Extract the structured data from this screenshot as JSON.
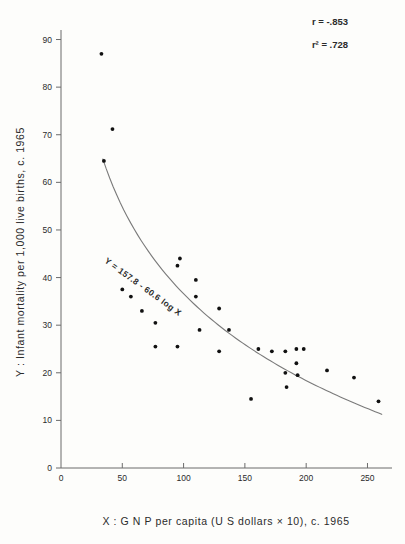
{
  "chart_data": {
    "type": "scatter",
    "title": "",
    "xlabel": "X : G N P  per  capita  (U S  dollars  × 10),  c. 1965",
    "ylabel": "Y :  Infant  mortality  per  1,000  live  births,  c. 1965",
    "xlim": [
      0,
      270
    ],
    "ylim": [
      0,
      92
    ],
    "xticks": [
      0,
      50,
      100,
      150,
      200,
      250
    ],
    "yticks": [
      0,
      10,
      20,
      30,
      40,
      50,
      60,
      70,
      80,
      90
    ],
    "xticklabels": [
      "0",
      "50",
      "100",
      "150",
      "200",
      "250"
    ],
    "yticklabels": [
      "0",
      "10",
      "20",
      "30",
      "40",
      "50",
      "60",
      "70",
      "80",
      "90"
    ],
    "grid": false,
    "legend": null,
    "annotations": [
      {
        "name": "correlation",
        "text": "r = -.853"
      },
      {
        "name": "r-squared",
        "text": "r² = .728"
      },
      {
        "name": "regression-equation",
        "text": "Y = 157.8 - 60.6 log X"
      }
    ],
    "points": [
      {
        "x": 33,
        "y": 87.0
      },
      {
        "x": 42,
        "y": 71.2
      },
      {
        "x": 35,
        "y": 64.5
      },
      {
        "x": 50,
        "y": 37.5
      },
      {
        "x": 57,
        "y": 36.0
      },
      {
        "x": 66,
        "y": 33.0
      },
      {
        "x": 77,
        "y": 30.5
      },
      {
        "x": 77,
        "y": 25.5
      },
      {
        "x": 95,
        "y": 42.5
      },
      {
        "x": 95,
        "y": 25.5
      },
      {
        "x": 97,
        "y": 44.0
      },
      {
        "x": 110,
        "y": 39.5
      },
      {
        "x": 110,
        "y": 36.0
      },
      {
        "x": 113,
        "y": 29.0
      },
      {
        "x": 129,
        "y": 24.5
      },
      {
        "x": 129,
        "y": 33.5
      },
      {
        "x": 137,
        "y": 29.0
      },
      {
        "x": 155,
        "y": 14.5
      },
      {
        "x": 161,
        "y": 25.0
      },
      {
        "x": 172,
        "y": 24.5
      },
      {
        "x": 183,
        "y": 24.5
      },
      {
        "x": 183,
        "y": 20.0
      },
      {
        "x": 184,
        "y": 17.0
      },
      {
        "x": 192,
        "y": 25.0
      },
      {
        "x": 192,
        "y": 22.0
      },
      {
        "x": 198,
        "y": 25.0
      },
      {
        "x": 193,
        "y": 19.5
      },
      {
        "x": 217,
        "y": 20.5
      },
      {
        "x": 239,
        "y": 19.0
      },
      {
        "x": 259,
        "y": 14.0
      }
    ],
    "fit_curve": {
      "name": "logarithmic-fit",
      "equation": "Y = 157.8 - 60.6 log X",
      "a": 157.8,
      "b": 60.6,
      "x_start": 34,
      "x_end": 262
    }
  },
  "axes": {
    "x_title": "X : G N P  per  capita  (U S  dollars  × 10),  c. 1965",
    "y_title": "Y :  Infant  mortality  per  1,000  live  births,  c. 1965"
  },
  "colors": {
    "point": "#111111",
    "axis": "#6b6b6b",
    "curve": "#7a7a7a",
    "background": "#fdfdfb"
  }
}
